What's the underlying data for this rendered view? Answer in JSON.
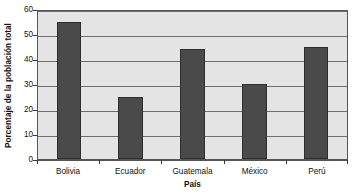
{
  "chart_data": {
    "type": "bar",
    "title": "",
    "categories": [
      "Bolivia",
      "Ecuador",
      "Guatemala",
      "México",
      "Perú"
    ],
    "values": [
      55,
      25,
      44,
      30,
      45
    ],
    "xlabel": "País",
    "ylabel": "Porcentaje de la población total",
    "ylim": [
      0,
      60
    ],
    "yticks": [
      0,
      10,
      20,
      30,
      40,
      50,
      60
    ],
    "ytick_labels": [
      "0",
      "10",
      "20",
      "30",
      "40",
      "50",
      "60"
    ],
    "grid": true,
    "grid_axis": "y",
    "legend": false,
    "legend_position": "none",
    "colors": {
      "bar_fill": "#4a4a4a",
      "bar_edge": "#2e2e2e",
      "plot_background": "#e4e4e4",
      "gridline": "#6e6e6e",
      "axis_line": "#555555",
      "text": "#111111",
      "figure_background": "#ffffff"
    }
  }
}
